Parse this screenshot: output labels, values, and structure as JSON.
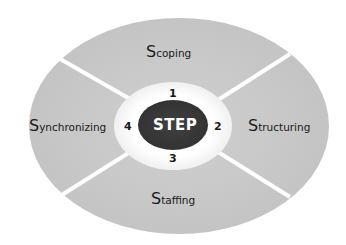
{
  "diagram": {
    "center": {
      "label": "STEP"
    },
    "phases": [
      {
        "number": "1",
        "initial": "S",
        "rest": "coping",
        "label": "Scoping",
        "position": "top"
      },
      {
        "number": "2",
        "initial": "S",
        "rest": "tructuring",
        "label": "Structuring",
        "position": "right"
      },
      {
        "number": "3",
        "initial": "S",
        "rest": "taffing",
        "label": "Staffing",
        "position": "bottom"
      },
      {
        "number": "4",
        "initial": "S",
        "rest": "ynchronizing",
        "label": "Synchronizing",
        "position": "left"
      }
    ],
    "colors": {
      "outer_fill": "#c6c6c6",
      "divider": "#ffffff",
      "inner_ring": "#ffffff",
      "center_fill": "#3a3a3a",
      "center_text": "#ffffff",
      "label_text": "#1a1a1a"
    }
  }
}
